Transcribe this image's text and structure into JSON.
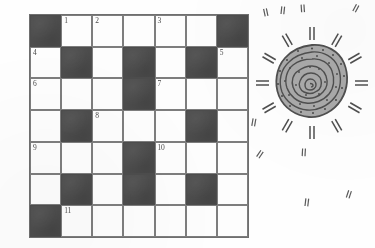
{
  "page": {
    "background_color": "#fefefe",
    "block_color": "#4c4c4c",
    "cell_color": "#fdfdfd",
    "grid_line_color": "#7d7d7d",
    "ink_color": "#4a4a4a"
  },
  "crossword": {
    "rows": 7,
    "columns": 7,
    "grid": [
      [
        {
          "type": "block"
        },
        {
          "type": "open",
          "number": "1"
        },
        {
          "type": "open",
          "number": "2"
        },
        {
          "type": "open",
          "number": ""
        },
        {
          "type": "open",
          "number": "3"
        },
        {
          "type": "open",
          "number": ""
        },
        {
          "type": "block"
        }
      ],
      [
        {
          "type": "open",
          "number": "4"
        },
        {
          "type": "block"
        },
        {
          "type": "open",
          "number": ""
        },
        {
          "type": "block"
        },
        {
          "type": "open",
          "number": ""
        },
        {
          "type": "block"
        },
        {
          "type": "open",
          "number": "5"
        }
      ],
      [
        {
          "type": "open",
          "number": "6"
        },
        {
          "type": "open",
          "number": ""
        },
        {
          "type": "open",
          "number": ""
        },
        {
          "type": "block"
        },
        {
          "type": "open",
          "number": "7"
        },
        {
          "type": "open",
          "number": ""
        },
        {
          "type": "open",
          "number": ""
        }
      ],
      [
        {
          "type": "open",
          "number": ""
        },
        {
          "type": "block"
        },
        {
          "type": "open",
          "number": "8"
        },
        {
          "type": "open",
          "number": ""
        },
        {
          "type": "open",
          "number": ""
        },
        {
          "type": "block"
        },
        {
          "type": "open",
          "number": ""
        }
      ],
      [
        {
          "type": "open",
          "number": "9"
        },
        {
          "type": "open",
          "number": ""
        },
        {
          "type": "open",
          "number": ""
        },
        {
          "type": "block"
        },
        {
          "type": "open",
          "number": "10"
        },
        {
          "type": "open",
          "number": ""
        },
        {
          "type": "open",
          "number": ""
        }
      ],
      [
        {
          "type": "open",
          "number": ""
        },
        {
          "type": "block"
        },
        {
          "type": "open",
          "number": ""
        },
        {
          "type": "block"
        },
        {
          "type": "open",
          "number": ""
        },
        {
          "type": "block"
        },
        {
          "type": "open",
          "number": ""
        }
      ],
      [
        {
          "type": "block"
        },
        {
          "type": "open",
          "number": "11"
        },
        {
          "type": "open",
          "number": ""
        },
        {
          "type": "open",
          "number": ""
        },
        {
          "type": "open",
          "number": ""
        },
        {
          "type": "open",
          "number": ""
        },
        {
          "type": "open",
          "number": ""
        }
      ]
    ]
  },
  "decoration": {
    "sun_motif": {
      "name": "spiral-sun-petroglyph",
      "ray_count": 12,
      "spiral_turns": 3,
      "body_fill": "#a9a9a9",
      "outline_color": "#555555"
    },
    "speckles": [
      {
        "x": 262,
        "y": 8,
        "rotate": -12
      },
      {
        "x": 279,
        "y": 6,
        "rotate": 6
      },
      {
        "x": 299,
        "y": 4,
        "rotate": -4
      },
      {
        "x": 352,
        "y": 4,
        "rotate": 28
      },
      {
        "x": 256,
        "y": 150,
        "rotate": 34
      },
      {
        "x": 300,
        "y": 148,
        "rotate": 3
      },
      {
        "x": 345,
        "y": 190,
        "rotate": 18
      },
      {
        "x": 303,
        "y": 198,
        "rotate": 7
      },
      {
        "x": 250,
        "y": 118,
        "rotate": 10
      }
    ]
  }
}
